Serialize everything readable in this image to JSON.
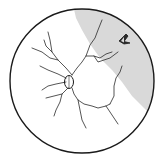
{
  "diagram": {
    "title": "",
    "colors": {
      "background": "#ffffff",
      "outline": "#1a1a1a",
      "vessel": "#2a2a2a",
      "detached_region": "#d9d9d9"
    },
    "elements": [
      {
        "name": "fundus-outline",
        "shape": "circle"
      },
      {
        "name": "optic-disc",
        "shape": "ellipse"
      },
      {
        "name": "retinal-vessels",
        "shape": "branching-lines"
      },
      {
        "name": "detached-retina-region",
        "shape": "shaded-area",
        "location": "upper-right"
      },
      {
        "name": "horseshoe-tear",
        "shape": "chevron",
        "location": "upper-right"
      }
    ],
    "labels": []
  }
}
